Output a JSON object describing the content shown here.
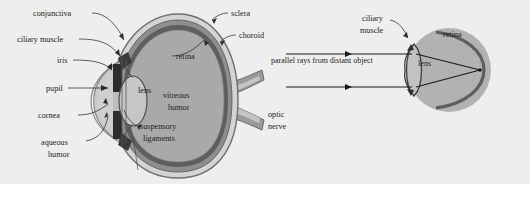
{
  "figure": {
    "background_color": "#eeeeee",
    "page_color": "#ffffff",
    "title": "",
    "panels": [
      {
        "id": "left",
        "name": "eye-cross-section"
      },
      {
        "id": "right",
        "name": "eye-focusing-distant-object"
      }
    ]
  },
  "colors": {
    "background": "#eeeeee",
    "sclera": "#d2d2d2",
    "choroid": "#8f8f8f",
    "retina_dark": "#5d5d5d",
    "vitreous": "#a8a8a8",
    "lens": "#c2c2c2",
    "iris_dark": "#2e2e2e",
    "outline": "#6a6a6a",
    "ray": "#1a1a1a",
    "text": "#1d1d1d"
  },
  "left_panel": {
    "name": "eye-cross-section-diagram",
    "labels": [
      {
        "id": "conjunctiva",
        "text": "conjunctiva",
        "x": 33,
        "y": 16
      },
      {
        "id": "ciliary-muscle",
        "text": "ciliary muscle",
        "x": 17,
        "y": 42
      },
      {
        "id": "iris",
        "text": "iris",
        "x": 57,
        "y": 63
      },
      {
        "id": "pupil",
        "text": "pupil",
        "x": 46,
        "y": 91
      },
      {
        "id": "cornea",
        "text": "cornea",
        "x": 38,
        "y": 118
      },
      {
        "id": "aqueous-humor-line1",
        "text": "aqueous",
        "x": 41,
        "y": 145
      },
      {
        "id": "aqueous-humor-line2",
        "text": "humor",
        "x": 48,
        "y": 157
      },
      {
        "id": "lens",
        "text": "lens",
        "x": 138,
        "y": 93
      },
      {
        "id": "suspensory-line1",
        "text": "suspensory",
        "x": 140,
        "y": 129
      },
      {
        "id": "suspensory-line2",
        "text": "ligaments",
        "x": 143,
        "y": 141
      },
      {
        "id": "vitreous-humor-line1",
        "text": "vitreous",
        "x": 163,
        "y": 98
      },
      {
        "id": "vitreous-humor-line2",
        "text": "humor",
        "x": 168,
        "y": 110
      },
      {
        "id": "retina",
        "text": "retina",
        "x": 176,
        "y": 59
      },
      {
        "id": "sclera",
        "text": "sclera",
        "x": 231,
        "y": 16
      },
      {
        "id": "choroid",
        "text": "choroid",
        "x": 239,
        "y": 38
      },
      {
        "id": "optic-nerve-line1",
        "text": "optic",
        "x": 268,
        "y": 117
      },
      {
        "id": "optic-nerve-line2",
        "text": "nerve",
        "x": 268,
        "y": 129
      }
    ]
  },
  "right_panel": {
    "name": "distant-object-focusing-diagram",
    "labels": [
      {
        "id": "ciliary-muscle-line1",
        "text": "ciliary",
        "x": 362,
        "y": 21
      },
      {
        "id": "ciliary-muscle-line2",
        "text": "muscle",
        "x": 360,
        "y": 33
      },
      {
        "id": "parallel-rays",
        "text": "parallel rays from distant object",
        "x": 271,
        "y": 63
      },
      {
        "id": "lens",
        "text": "lens",
        "x": 418,
        "y": 66
      },
      {
        "id": "retina",
        "text": "retina",
        "x": 443,
        "y": 37
      }
    ],
    "rays": [
      {
        "id": "ray-upper",
        "y": 54
      },
      {
        "id": "ray-lower",
        "y": 87
      }
    ]
  }
}
